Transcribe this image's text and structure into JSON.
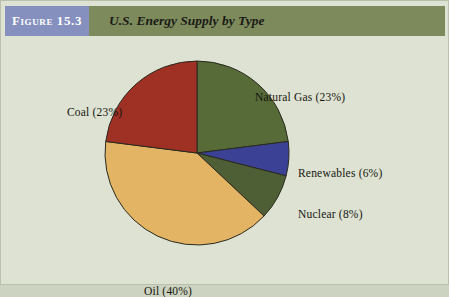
{
  "figure": {
    "badge_label": "Figure 15.3",
    "title": "U.S. Energy Supply by Type"
  },
  "colors": {
    "page_background": "#dde2d2",
    "header_band": "#7d8a5c",
    "badge": "#8690be",
    "badge_text": "#ffffff",
    "title_text": "#1b1b17",
    "label_text": "#16160f",
    "slice_outline": "#2a2a20"
  },
  "labels": {
    "natural_gas": "Natural Gas (23%)",
    "coal": "Coal (23%)",
    "renewables": "Renewables (6%)",
    "nuclear": "Nuclear (8%)",
    "oil": "Oil (40%)"
  },
  "chart_data": {
    "type": "pie",
    "title": "U.S. Energy Supply by Type",
    "xlabel": "",
    "ylabel": "",
    "legend_position": "none",
    "grid": false,
    "value_unit": "percent",
    "total": 100,
    "start_angle_deg": 0,
    "direction": "clockwise",
    "categories": [
      "Natural Gas",
      "Renewables",
      "Nuclear",
      "Oil",
      "Coal"
    ],
    "values": [
      23,
      6,
      8,
      40,
      23
    ],
    "slices": [
      {
        "name": "Natural Gas",
        "value": 23,
        "label": "Natural Gas (23%)",
        "color": "#566b38"
      },
      {
        "name": "Renewables",
        "value": 6,
        "label": "Renewables (6%)",
        "color": "#3b4296"
      },
      {
        "name": "Nuclear",
        "value": 8,
        "label": "Nuclear (8%)",
        "color": "#4e5f35"
      },
      {
        "name": "Oil",
        "value": 40,
        "label": "Oil (40%)",
        "color": "#e2b463"
      },
      {
        "name": "Coal",
        "value": 23,
        "label": "Coal (23%)",
        "color": "#9e3024"
      }
    ]
  }
}
